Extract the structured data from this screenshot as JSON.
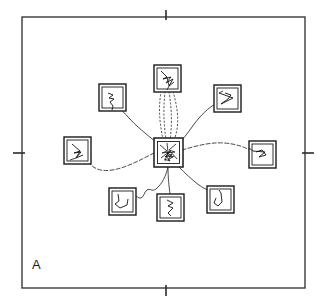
{
  "figure": {
    "panel_label": "A",
    "background_color": "#ffffff",
    "ink_color": "#1a1a1a",
    "width": 329,
    "height": 304,
    "caption_text": "",
    "frame": {
      "name": "arena-frame",
      "x": 22,
      "y": 17,
      "width": 283,
      "height": 271,
      "stroke": "#2b2b2b",
      "stroke_width": 1.2
    },
    "axis_ticks": [
      {
        "name": "tick-top",
        "side": "top",
        "x": 166,
        "y": 17,
        "length": 9
      },
      {
        "name": "tick-bottom",
        "side": "bottom",
        "x": 166,
        "y": 288,
        "length": 9
      },
      {
        "name": "tick-left",
        "side": "left",
        "x": 22,
        "y": 153,
        "length": 9
      },
      {
        "name": "tick-right",
        "side": "right",
        "x": 305,
        "y": 153,
        "length": 9
      }
    ],
    "center_node": {
      "name": "center-box",
      "label": "center",
      "cx": 168,
      "cy": 152,
      "size": 28,
      "double_border": true,
      "track": "center-dense-track"
    },
    "peripheral_nodes": [
      {
        "name": "box-north",
        "label": "N",
        "cx": 167,
        "cy": 78,
        "size": 26,
        "track": "squiggle-n"
      },
      {
        "name": "box-northwest",
        "label": "NW",
        "cx": 112,
        "cy": 97,
        "size": 26,
        "track": "squiggle-nw"
      },
      {
        "name": "box-northeast",
        "label": "NE",
        "cx": 227,
        "cy": 98,
        "size": 26,
        "track": "squiggle-ne"
      },
      {
        "name": "box-west",
        "label": "W",
        "cx": 77,
        "cy": 150,
        "size": 26,
        "track": "squiggle-w"
      },
      {
        "name": "box-east",
        "label": "E",
        "cx": 262,
        "cy": 154,
        "size": 26,
        "track": "squiggle-e"
      },
      {
        "name": "box-southwest",
        "label": "SW",
        "cx": 122,
        "cy": 201,
        "size": 26,
        "track": "squiggle-sw"
      },
      {
        "name": "box-south",
        "label": "S",
        "cx": 170,
        "cy": 207,
        "size": 26,
        "track": "squiggle-s"
      },
      {
        "name": "box-southeast",
        "label": "SE",
        "cx": 220,
        "cy": 199,
        "size": 26,
        "track": "squiggle-se"
      }
    ],
    "connections": [
      {
        "name": "path-center-to-north-1",
        "style": "dotted",
        "from": "center",
        "to": "box-north"
      },
      {
        "name": "path-center-to-north-2",
        "style": "dotted",
        "from": "center",
        "to": "box-north"
      },
      {
        "name": "path-center-to-north-3",
        "style": "dotted",
        "from": "center",
        "to": "box-north"
      },
      {
        "name": "path-center-to-north-4",
        "style": "dotted",
        "from": "center",
        "to": "box-north"
      },
      {
        "name": "path-center-to-northwest",
        "style": "solid",
        "from": "center",
        "to": "box-northwest"
      },
      {
        "name": "path-center-to-northeast",
        "style": "solid",
        "from": "center",
        "to": "box-northeast"
      },
      {
        "name": "path-center-to-west",
        "style": "dashed",
        "from": "center",
        "to": "box-west"
      },
      {
        "name": "path-center-to-east",
        "style": "dashed",
        "from": "center",
        "to": "box-east"
      },
      {
        "name": "path-center-to-southwest",
        "style": "solid-wavy",
        "from": "center",
        "to": "box-southwest"
      },
      {
        "name": "path-center-to-south",
        "style": "solid",
        "from": "center",
        "to": "box-south"
      },
      {
        "name": "path-center-to-southeast",
        "style": "solid",
        "from": "center",
        "to": "box-southeast"
      }
    ]
  }
}
